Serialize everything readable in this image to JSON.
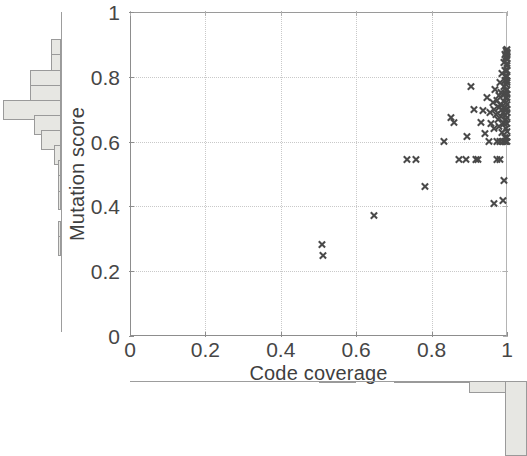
{
  "chart_data": {
    "type": "scatter",
    "title": "",
    "xlabel": "Code coverage",
    "ylabel": "Mutation score",
    "xlim": [
      0,
      1
    ],
    "ylim": [
      0,
      1
    ],
    "xticks": [
      "0",
      "0.2",
      "0.4",
      "0.6",
      "0.8",
      "1"
    ],
    "xtick_values": [
      0,
      0.2,
      0.4,
      0.6,
      0.8,
      1
    ],
    "yticks": [
      "0",
      "0.2",
      "0.4",
      "0.6",
      "0.8",
      "1"
    ],
    "ytick_values": [
      0,
      0.2,
      0.4,
      0.6,
      0.8,
      1
    ],
    "grid": true,
    "grid_style": "dotted",
    "legend": null,
    "marker": "x",
    "marker_color": "#4a4a4a",
    "points": [
      [
        0.508,
        0.282
      ],
      [
        0.511,
        0.248
      ],
      [
        0.646,
        0.372
      ],
      [
        0.735,
        0.545
      ],
      [
        0.757,
        0.545
      ],
      [
        0.782,
        0.462
      ],
      [
        0.833,
        0.6
      ],
      [
        0.852,
        0.675
      ],
      [
        0.86,
        0.66
      ],
      [
        0.872,
        0.545
      ],
      [
        0.89,
        0.545
      ],
      [
        0.893,
        0.615
      ],
      [
        0.903,
        0.77
      ],
      [
        0.912,
        0.7
      ],
      [
        0.918,
        0.545
      ],
      [
        0.922,
        0.545
      ],
      [
        0.93,
        0.66
      ],
      [
        0.936,
        0.695
      ],
      [
        0.941,
        0.625
      ],
      [
        0.947,
        0.735
      ],
      [
        0.951,
        0.6
      ],
      [
        0.955,
        0.69
      ],
      [
        0.958,
        0.655
      ],
      [
        0.962,
        0.72
      ],
      [
        0.964,
        0.64
      ],
      [
        0.966,
        0.7
      ],
      [
        0.968,
        0.76
      ],
      [
        0.97,
        0.685
      ],
      [
        0.972,
        0.6
      ],
      [
        0.974,
        0.728
      ],
      [
        0.975,
        0.668
      ],
      [
        0.977,
        0.742
      ],
      [
        0.978,
        0.705
      ],
      [
        0.979,
        0.648
      ],
      [
        0.98,
        0.782
      ],
      [
        0.981,
        0.6
      ],
      [
        0.982,
        0.716
      ],
      [
        0.983,
        0.676
      ],
      [
        0.984,
        0.752
      ],
      [
        0.985,
        0.628
      ],
      [
        0.986,
        0.7
      ],
      [
        0.987,
        0.81
      ],
      [
        0.988,
        0.66
      ],
      [
        0.989,
        0.745
      ],
      [
        0.99,
        0.69
      ],
      [
        0.99,
        0.6
      ],
      [
        0.991,
        0.77
      ],
      [
        0.991,
        0.725
      ],
      [
        0.992,
        0.845
      ],
      [
        0.992,
        0.655
      ],
      [
        0.993,
        0.705
      ],
      [
        0.993,
        0.79
      ],
      [
        0.994,
        0.612
      ],
      [
        0.994,
        0.748
      ],
      [
        0.994,
        0.868
      ],
      [
        0.995,
        0.682
      ],
      [
        0.995,
        0.82
      ],
      [
        0.995,
        0.6
      ],
      [
        0.996,
        0.735
      ],
      [
        0.996,
        0.855
      ],
      [
        0.996,
        0.668
      ],
      [
        0.997,
        0.775
      ],
      [
        0.997,
        0.7
      ],
      [
        0.997,
        0.882
      ],
      [
        0.997,
        0.64
      ],
      [
        0.998,
        0.805
      ],
      [
        0.998,
        0.722
      ],
      [
        0.998,
        0.862
      ],
      [
        0.998,
        0.6
      ],
      [
        0.998,
        0.758
      ],
      [
        0.999,
        0.835
      ],
      [
        0.999,
        0.69
      ],
      [
        0.999,
        0.875
      ],
      [
        0.999,
        0.745
      ],
      [
        0.999,
        0.612
      ],
      [
        0.999,
        0.8
      ],
      [
        1.0,
        0.865
      ],
      [
        1.0,
        0.715
      ],
      [
        1.0,
        0.782
      ],
      [
        1.0,
        0.655
      ],
      [
        1.0,
        0.84
      ],
      [
        1.0,
        0.6
      ],
      [
        1.0,
        0.76
      ],
      [
        1.0,
        0.885
      ],
      [
        1.0,
        0.7
      ],
      [
        1.0,
        0.82
      ],
      [
        1.0,
        0.735
      ],
      [
        1.0,
        0.63
      ],
      [
        1.0,
        0.855
      ],
      [
        1.0,
        0.675
      ],
      [
        1.0,
        0.79
      ],
      [
        1.0,
        0.875
      ],
      [
        0.965,
        0.408
      ],
      [
        0.988,
        0.418
      ],
      [
        0.992,
        0.48
      ],
      [
        0.974,
        0.545
      ],
      [
        0.98,
        0.545
      ]
    ],
    "marginal_y": {
      "orientation": "horizontal",
      "description": "Mutation score distribution histogram on left margin",
      "bins": [
        {
          "center": 0.885,
          "count": 3
        },
        {
          "center": 0.835,
          "count": 3
        },
        {
          "center": 0.785,
          "count": 9
        },
        {
          "center": 0.735,
          "count": 9
        },
        {
          "center": 0.685,
          "count": 17
        },
        {
          "center": 0.635,
          "count": 8
        },
        {
          "center": 0.585,
          "count": 6
        },
        {
          "center": 0.535,
          "count": 2
        },
        {
          "center": 0.485,
          "count": 1
        },
        {
          "center": 0.435,
          "count": 1
        },
        {
          "center": 0.385,
          "count": 1
        },
        {
          "center": 0.335,
          "count": 0
        },
        {
          "center": 0.285,
          "count": 1
        },
        {
          "center": 0.235,
          "count": 1
        },
        {
          "center": 0.185,
          "count": 0
        },
        {
          "center": 0.135,
          "count": 0
        },
        {
          "center": 0.085,
          "count": 0
        }
      ],
      "max_count": 17
    },
    "marginal_x": {
      "orientation": "vertical",
      "description": "Code coverage distribution histogram on bottom margin",
      "bins": [
        {
          "center": 0.05,
          "count": 0
        },
        {
          "center": 0.15,
          "count": 0
        },
        {
          "center": 0.25,
          "count": 0
        },
        {
          "center": 0.35,
          "count": 0
        },
        {
          "center": 0.45,
          "count": 0
        },
        {
          "center": 0.55,
          "count": 1
        },
        {
          "center": 0.65,
          "count": 0
        },
        {
          "center": 0.75,
          "count": 1
        },
        {
          "center": 0.85,
          "count": 2
        },
        {
          "center": 0.95,
          "count": 12
        },
        {
          "center": 1.0,
          "count": 76
        }
      ],
      "max_count": 76
    }
  }
}
